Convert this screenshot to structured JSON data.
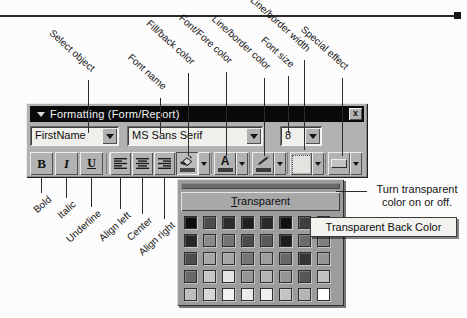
{
  "callouts": {
    "top": [
      {
        "label": "Select object"
      },
      {
        "label": "Font name"
      },
      {
        "label": "Fill/back color"
      },
      {
        "label": "Font/Fore color"
      },
      {
        "label": "Line/border color"
      },
      {
        "label": "Font size"
      },
      {
        "label": "Line/border width"
      },
      {
        "label": "Special effect"
      }
    ],
    "bottom": [
      {
        "label": "Bold"
      },
      {
        "label": "Italic"
      },
      {
        "label": "Underline"
      },
      {
        "label": "Align left"
      },
      {
        "label": "Center"
      },
      {
        "label": "Align right"
      }
    ]
  },
  "toolbar": {
    "title": "Formatting (Form/Report)",
    "close_label": "x",
    "field_combo": {
      "value": "FirstName"
    },
    "font_combo": {
      "value": "MS Sans Serif"
    },
    "size_combo": {
      "value": "8"
    },
    "buttons": {
      "bold": "B",
      "italic": "I",
      "underline": "U",
      "font_color_letter": "A"
    },
    "bar_colors": {
      "fill_back": "#4a4a4a",
      "font_fore": "#3a3a3a",
      "line_border": "#3a3a3a"
    }
  },
  "palette": {
    "transparent_initial": "T",
    "transparent_rest": "ransparent",
    "rows": [
      [
        "#0d0d0d",
        "#4c4c4c",
        "#2d2d2d",
        "#1f1f1f",
        "#2a2a2a",
        "#101010",
        "#3e3e3e",
        "#343434"
      ],
      [
        "#262626",
        "#8a8a8a",
        "#737373",
        "#4b4b4b",
        "#5a5a5a",
        "#1d1d1d",
        "#6c6c6c",
        "#808080"
      ],
      [
        "#4d4d4d",
        "#a8a8a8",
        "#a6a6a6",
        "#757575",
        "#9e9e9e",
        "#686868",
        "#353535",
        "#969696"
      ],
      [
        "#696969",
        "#c6c6c6",
        "#e4e4e4",
        "#969696",
        "#b3b3b3",
        "#949494",
        "#575757",
        "#c0c0c0"
      ],
      [
        "#bdbdbd",
        "#d7d7d7",
        "#f3f3f3",
        "#eaeaea",
        "#f0f0f0",
        "#c3c3c3",
        "#b5b5b5",
        "#ffffff"
      ]
    ]
  },
  "tooltip": {
    "text": "Transparent Back Color"
  },
  "note": {
    "line1": "Turn transparent",
    "line2": "color on or off."
  }
}
